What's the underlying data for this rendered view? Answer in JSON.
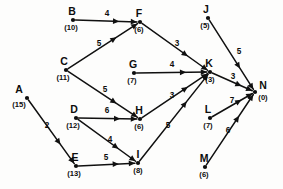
{
  "diagram": {
    "type": "directed-network-graph",
    "title": "",
    "nodes": [
      {
        "id": "A",
        "label": "A",
        "value": "(15)",
        "x": 27,
        "y": 98,
        "label_dx": -8,
        "label_dy": -5,
        "value_dx": -8,
        "value_dy": 9
      },
      {
        "id": "B",
        "label": "B",
        "value": "(10)",
        "x": 73,
        "y": 20,
        "label_dx": -1,
        "label_dy": -5,
        "value_dx": -2,
        "value_dy": 10
      },
      {
        "id": "C",
        "label": "C",
        "value": "(11)",
        "x": 66,
        "y": 70,
        "label_dx": -2,
        "label_dy": -5,
        "value_dx": -3,
        "value_dy": 10
      },
      {
        "id": "D",
        "label": "D",
        "value": "(12)",
        "x": 76,
        "y": 118,
        "label_dx": -2,
        "label_dy": -5,
        "value_dx": -3,
        "value_dy": 10
      },
      {
        "id": "E",
        "label": "E",
        "value": "(13)",
        "x": 76,
        "y": 166,
        "label_dx": -1,
        "label_dy": -5,
        "value_dx": -2,
        "value_dy": 10
      },
      {
        "id": "F",
        "label": "F",
        "value": "(6)",
        "x": 140,
        "y": 22,
        "label_dx": -1,
        "label_dy": -5,
        "value_dx": -1,
        "value_dy": 10
      },
      {
        "id": "G",
        "label": "G",
        "value": "(7)",
        "x": 134,
        "y": 73,
        "label_dx": -1,
        "label_dy": -5,
        "value_dx": -2,
        "value_dy": 10
      },
      {
        "id": "H",
        "label": "H",
        "value": "(6)",
        "x": 140,
        "y": 119,
        "label_dx": -1,
        "label_dy": -5,
        "value_dx": -1,
        "value_dy": 10
      },
      {
        "id": "I",
        "label": "I",
        "value": "(8)",
        "x": 138,
        "y": 163,
        "label_dx": 0,
        "label_dy": -5,
        "value_dx": 0,
        "value_dy": 10
      },
      {
        "id": "J",
        "label": "J",
        "value": "(5)",
        "x": 208,
        "y": 18,
        "label_dx": -2,
        "label_dy": -5,
        "value_dx": -3,
        "value_dy": 10
      },
      {
        "id": "K",
        "label": "K",
        "value": "(3)",
        "x": 210,
        "y": 72,
        "label_dx": -1,
        "label_dy": -5,
        "value_dx": 0,
        "value_dy": 10
      },
      {
        "id": "L",
        "label": "L",
        "value": "(7)",
        "x": 210,
        "y": 118,
        "label_dx": -2,
        "label_dy": -5,
        "value_dx": -2,
        "value_dy": 10
      },
      {
        "id": "M",
        "label": "M",
        "value": "(6)",
        "x": 205,
        "y": 167,
        "label_dx": -1,
        "label_dy": -5,
        "value_dx": -1,
        "value_dy": 10
      },
      {
        "id": "N",
        "label": "N",
        "value": "(0)",
        "x": 255,
        "y": 92,
        "label_dx": 8,
        "label_dy": -3,
        "value_dx": 8,
        "value_dy": 8
      }
    ],
    "edges": [
      {
        "from": "B",
        "to": "F",
        "weight": "4",
        "wx": 107,
        "wy": 16
      },
      {
        "from": "C",
        "to": "F",
        "weight": "5",
        "wx": 99,
        "wy": 46
      },
      {
        "from": "C",
        "to": "H",
        "weight": "5",
        "wx": 105,
        "wy": 92
      },
      {
        "from": "F",
        "to": "K",
        "weight": "3",
        "wx": 177,
        "wy": 46
      },
      {
        "from": "G",
        "to": "K",
        "weight": "4",
        "wx": 172,
        "wy": 67
      },
      {
        "from": "H",
        "to": "K",
        "weight": "3",
        "wx": 172,
        "wy": 98
      },
      {
        "from": "I",
        "to": "K",
        "weight": "5",
        "wx": 168,
        "wy": 128
      },
      {
        "from": "D",
        "to": "H",
        "weight": "6",
        "wx": 107,
        "wy": 113
      },
      {
        "from": "D",
        "to": "I",
        "weight": "4",
        "wx": 110,
        "wy": 142
      },
      {
        "from": "E",
        "to": "I",
        "weight": "5",
        "wx": 106,
        "wy": 160
      },
      {
        "from": "A",
        "to": "E",
        "weight": "2",
        "wx": 47,
        "wy": 128
      },
      {
        "from": "J",
        "to": "N",
        "weight": "5",
        "wx": 239,
        "wy": 54
      },
      {
        "from": "K",
        "to": "N",
        "weight": "3",
        "wx": 233,
        "wy": 79
      },
      {
        "from": "L",
        "to": "N",
        "weight": "7",
        "wx": 232,
        "wy": 103
      },
      {
        "from": "M",
        "to": "N",
        "weight": "6",
        "wx": 228,
        "wy": 133
      }
    ],
    "colors": {
      "ink": "#0d0d0d",
      "background": "#fdfdfc"
    }
  }
}
